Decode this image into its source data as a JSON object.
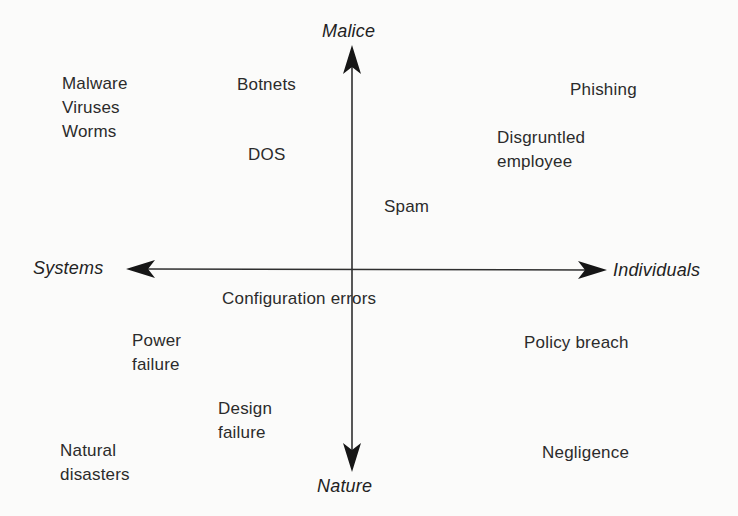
{
  "diagram": {
    "axes": {
      "top": "Malice",
      "bottom": "Nature",
      "left": "Systems",
      "right": "Individuals"
    },
    "items": [
      {
        "text": "Malware"
      },
      {
        "text": "Viruses"
      },
      {
        "text": "Worms"
      },
      {
        "text": "Botnets"
      },
      {
        "text": "DOS"
      },
      {
        "text": "Phishing"
      },
      {
        "text": "Disgruntled\nemployee"
      },
      {
        "text": "Spam"
      },
      {
        "text": "Configuration errors"
      },
      {
        "text": "Power\nfailure"
      },
      {
        "text": "Design\nfailure"
      },
      {
        "text": "Natural\ndisasters"
      },
      {
        "text": "Policy breach"
      },
      {
        "text": "Negligence"
      }
    ],
    "colors": {
      "background": "#fbfbfa",
      "line": "#2f2f2f",
      "text": "#2b2b2b"
    }
  }
}
